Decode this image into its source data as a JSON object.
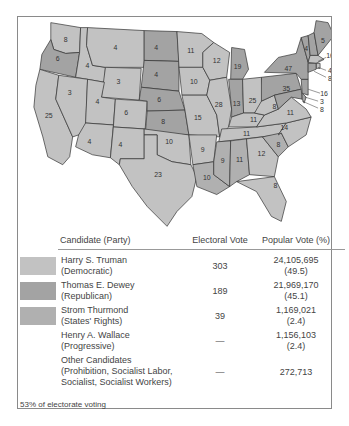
{
  "map": {
    "title": "1948 Presidential Election Electoral Map",
    "colors": {
      "democratic": "#c2c2c2",
      "republican": "#a3a3a3",
      "states_rights": "#b0b0b0"
    },
    "states": [
      {
        "abbr": "WA",
        "ev": "8",
        "party": "dem"
      },
      {
        "abbr": "OR",
        "ev": "6",
        "party": "rep"
      },
      {
        "abbr": "CA",
        "ev": "25",
        "party": "dem"
      },
      {
        "abbr": "ID",
        "ev": "4",
        "party": "dem"
      },
      {
        "abbr": "NV",
        "ev": "3",
        "party": "dem"
      },
      {
        "abbr": "MT",
        "ev": "4",
        "party": "dem"
      },
      {
        "abbr": "WY",
        "ev": "3",
        "party": "dem"
      },
      {
        "abbr": "UT",
        "ev": "4",
        "party": "dem"
      },
      {
        "abbr": "CO",
        "ev": "6",
        "party": "dem"
      },
      {
        "abbr": "AZ",
        "ev": "4",
        "party": "dem"
      },
      {
        "abbr": "NM",
        "ev": "4",
        "party": "dem"
      },
      {
        "abbr": "ND",
        "ev": "4",
        "party": "rep"
      },
      {
        "abbr": "SD",
        "ev": "4",
        "party": "rep"
      },
      {
        "abbr": "NE",
        "ev": "6",
        "party": "rep"
      },
      {
        "abbr": "KS",
        "ev": "8",
        "party": "rep"
      },
      {
        "abbr": "OK",
        "ev": "10",
        "party": "dem"
      },
      {
        "abbr": "TX",
        "ev": "23",
        "party": "dem"
      },
      {
        "abbr": "MN",
        "ev": "11",
        "party": "dem"
      },
      {
        "abbr": "IA",
        "ev": "10",
        "party": "dem"
      },
      {
        "abbr": "MO",
        "ev": "15",
        "party": "dem"
      },
      {
        "abbr": "AR",
        "ev": "9",
        "party": "dem"
      },
      {
        "abbr": "LA",
        "ev": "10",
        "party": "dix"
      },
      {
        "abbr": "WI",
        "ev": "12",
        "party": "dem"
      },
      {
        "abbr": "IL",
        "ev": "28",
        "party": "dem"
      },
      {
        "abbr": "MI",
        "ev": "19",
        "party": "rep"
      },
      {
        "abbr": "IN",
        "ev": "13",
        "party": "rep"
      },
      {
        "abbr": "OH",
        "ev": "25",
        "party": "dem"
      },
      {
        "abbr": "KY",
        "ev": "11",
        "party": "dem"
      },
      {
        "abbr": "TN",
        "ev": "11",
        "party": "dem"
      },
      {
        "abbr": "MS",
        "ev": "9",
        "party": "dix"
      },
      {
        "abbr": "AL",
        "ev": "11",
        "party": "dix"
      },
      {
        "abbr": "GA",
        "ev": "12",
        "party": "dem"
      },
      {
        "abbr": "FL",
        "ev": "8",
        "party": "dem"
      },
      {
        "abbr": "SC",
        "ev": "8",
        "party": "dix"
      },
      {
        "abbr": "NC",
        "ev": "14",
        "party": "dem"
      },
      {
        "abbr": "VA",
        "ev": "11",
        "party": "dem"
      },
      {
        "abbr": "WV",
        "ev": "8",
        "party": "dem"
      },
      {
        "abbr": "PA",
        "ev": "35",
        "party": "rep"
      },
      {
        "abbr": "NY",
        "ev": "47",
        "party": "rep"
      },
      {
        "abbr": "VT",
        "ev": "3",
        "party": "rep"
      },
      {
        "abbr": "NH",
        "ev": "4",
        "party": "rep"
      },
      {
        "abbr": "ME",
        "ev": "5",
        "party": "rep"
      },
      {
        "abbr": "MA",
        "ev": "16",
        "party": "dem"
      },
      {
        "abbr": "RI",
        "ev": "4",
        "party": "dem"
      },
      {
        "abbr": "CT",
        "ev": "8",
        "party": "rep"
      },
      {
        "abbr": "NJ",
        "ev": "16",
        "party": "rep"
      },
      {
        "abbr": "DE",
        "ev": "3",
        "party": "rep"
      },
      {
        "abbr": "MD",
        "ev": "8",
        "party": "rep"
      }
    ]
  },
  "table": {
    "headers": {
      "candidate": "Candidate (Party)",
      "electoral": "Electoral Vote",
      "popular": "Popular Vote (%)"
    },
    "rows": [
      {
        "name": "Harry S. Truman",
        "party": "(Democratic)",
        "electoral": "303",
        "popular": "24,105,695",
        "pct": "(49.5)",
        "swatch": "#c2c2c2"
      },
      {
        "name": "Thomas E. Dewey",
        "party": "(Republican)",
        "electoral": "189",
        "popular": "21,969,170",
        "pct": "(45.1)",
        "swatch": "#a3a3a3"
      },
      {
        "name": "Strom Thurmond",
        "party": "(States' Rights)",
        "electoral": "39",
        "popular": "1,169,021",
        "pct": "(2.4)",
        "swatch": "#b0b0b0"
      },
      {
        "name": "Henry A. Wallace",
        "party": "(Progressive)",
        "electoral": "—",
        "popular": "1,156,103",
        "pct": "(2.4)",
        "swatch": ""
      },
      {
        "name": "Other Candidates",
        "party": "(Prohibition, Socialist Labor,",
        "party2": "Socialist, Socialist Workers)",
        "electoral": "—",
        "popular": "272,713",
        "pct": "",
        "swatch": ""
      }
    ]
  },
  "footnote": "53% of electorate voting"
}
